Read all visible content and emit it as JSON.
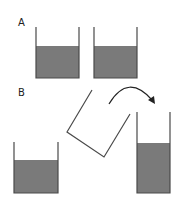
{
  "colors": {
    "fill": "#7a7a7a",
    "wall": "#4a4a4a",
    "arrow": "#222222",
    "background": "#ffffff"
  },
  "panels": [
    {
      "label": "A",
      "containers": [
        {
          "id": "A1",
          "left": 36,
          "right": 79,
          "top": 27,
          "fill_top": 46,
          "bottom": 78
        },
        {
          "id": "A2",
          "left": 94,
          "right": 137,
          "top": 27,
          "fill_top": 46,
          "bottom": 78
        }
      ]
    },
    {
      "label": "B",
      "containers": [
        {
          "id": "B1",
          "left": 14,
          "right": 58,
          "top": 142,
          "fill_top": 160,
          "bottom": 193
        },
        {
          "id": "B2",
          "left": 137,
          "right": 170,
          "top": 112,
          "fill_top": 143,
          "bottom": 193
        }
      ],
      "tilted_container": {
        "points": [
          [
            92,
            90
          ],
          [
            67,
            132
          ],
          [
            104,
            157
          ],
          [
            130,
            114
          ]
        ]
      },
      "pour_arrow": {
        "start": [
          109,
          104
        ],
        "control": [
          130,
          72
        ],
        "end": [
          153,
          102
        ]
      }
    }
  ]
}
